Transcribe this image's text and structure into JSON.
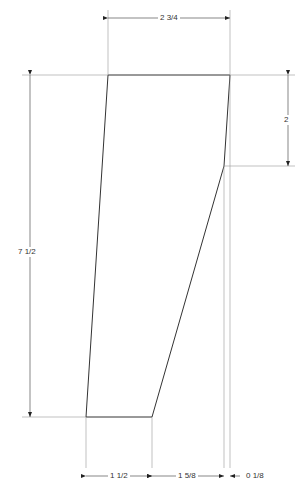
{
  "diagram": {
    "type": "dimensioned-drawing",
    "shape": "quadrilateral panel",
    "dimensions": {
      "top_width": "2 3/4",
      "right_drop": "2",
      "height": "7 1/2",
      "bottom_left": "1 1/2",
      "bottom_middle": "1 5/8",
      "bottom_right": "0 1/8"
    },
    "colors": {
      "outline": "#333333",
      "dimension_line": "#888888",
      "background": "#ffffff"
    }
  }
}
